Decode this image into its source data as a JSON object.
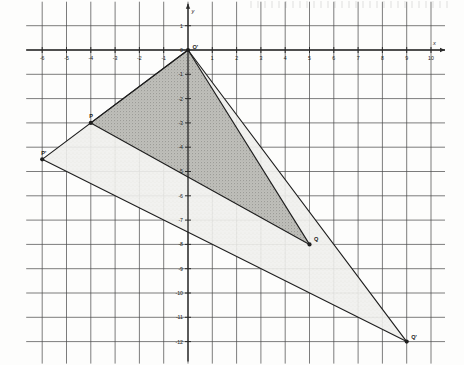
{
  "figure": {
    "title": "",
    "type": "geometry-dilation-diagram"
  },
  "axes": {
    "x_label": "x",
    "y_label": "y",
    "x_min": -6,
    "x_max": 10,
    "y_min": -12,
    "y_max": 1,
    "x_tick_labels": [
      "-6",
      "-5",
      "-4",
      "-3",
      "-2",
      "-1",
      "0",
      "1",
      "2",
      "3",
      "4",
      "5",
      "6",
      "7",
      "8",
      "9",
      "10"
    ],
    "y_tick_labels": [
      "1",
      "0",
      "-1",
      "-2",
      "-3",
      "-4",
      "-5",
      "-6",
      "-7",
      "-8",
      "-9",
      "-10",
      "-11",
      "-12"
    ],
    "origin_label": "0",
    "grid": true,
    "grid_step": 1
  },
  "chart_data": {
    "type": "scatter",
    "title": "",
    "xlabel": "x",
    "ylabel": "y",
    "xlim": [
      -6,
      10
    ],
    "ylim": [
      -12,
      1
    ],
    "grid": true,
    "points": [
      {
        "name": "O'",
        "label": "O'",
        "x": 0,
        "y": 0
      },
      {
        "name": "P",
        "label": "P",
        "x": -4,
        "y": -3
      },
      {
        "name": "Q",
        "label": "Q",
        "x": 5,
        "y": -8
      },
      {
        "name": "P'",
        "label": "P'",
        "x": -6,
        "y": -4.5
      },
      {
        "name": "Q'",
        "label": "Q'",
        "x": 9,
        "y": -12
      }
    ],
    "polygons": [
      {
        "name": "image-triangle-outer",
        "vertices": [
          "O'",
          "P'",
          "Q'"
        ],
        "shading": "light",
        "fill": "#ededea"
      },
      {
        "name": "preimage-triangle-inner",
        "vertices": [
          "O'",
          "P",
          "Q"
        ],
        "shading": "dark",
        "fill": "#b9b9b4"
      }
    ],
    "scale_factor": 1.5,
    "center_of_dilation": "O'"
  },
  "colors": {
    "grid_line": "#4a4a4a",
    "axis_line": "#2b2b2b",
    "shape_outline": "#1f1f1f",
    "fill_dark": "#b9b9b4",
    "fill_light": "#ededea",
    "paper": "#fdfdfc",
    "text": "#1a1a1a"
  }
}
